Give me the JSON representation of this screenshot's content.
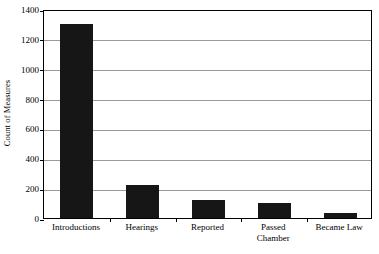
{
  "chart_data": {
    "type": "bar",
    "title": "",
    "subtitle": "",
    "xlabel": "",
    "ylabel": "Count of Measures",
    "categories": [
      "Introductions",
      "Hearings",
      "Reported",
      "Passed\nChamber",
      "Became Law"
    ],
    "values": [
      1300,
      220,
      120,
      100,
      35
    ],
    "ylim": [
      0,
      1400
    ],
    "ytick_values": [
      0,
      200,
      400,
      600,
      800,
      1000,
      1200,
      1400
    ],
    "ytick_labels": [
      "0",
      "200",
      "400",
      "600",
      "800",
      "1000",
      "1200",
      "1400"
    ],
    "grid": true,
    "grid_axis": "y",
    "legend": false,
    "legend_position": "none",
    "bar_color": "#161616",
    "gridline_color": "#9a9a9a",
    "axis_color": "#000000",
    "background_color": "#ffffff"
  }
}
